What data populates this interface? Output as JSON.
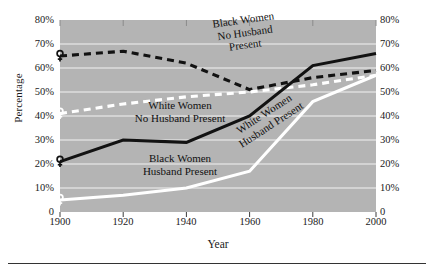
{
  "axes": {
    "ylabel": "Percentage",
    "xlabel": "Year",
    "yticks": [
      "80%",
      "70%",
      "60%",
      "50%",
      "40%",
      "30%",
      "20%",
      "10%",
      "0"
    ],
    "yticks_right": [
      "80%",
      "70%",
      "60%",
      "50%",
      "40%",
      "30%",
      "20%",
      "10%",
      "0"
    ],
    "xticks": [
      "1900",
      "1920",
      "1940",
      "1960",
      "1980",
      "2000"
    ]
  },
  "annotations": {
    "black_no_husband_line1": "Black Women",
    "black_no_husband_line2": "No Husband",
    "black_no_husband_line3": "Present",
    "white_no_husband_line1": "White Women",
    "white_no_husband_line2": "No Husband Present",
    "black_husband_line1": "Black Women",
    "black_husband_line2": "Husband Present",
    "white_husband_line1": "White Women",
    "white_husband_line2": "Husband Present"
  },
  "colors": {
    "plot_background": "#b4b4b4",
    "gridline": "#f2f2f2",
    "black_series": "#121212",
    "white_series": "#ffffff",
    "text": "#1a1a1a"
  },
  "chart_data": {
    "type": "line",
    "title": "",
    "xlabel": "Year",
    "ylabel": "Percentage",
    "x": [
      1900,
      1920,
      1940,
      1960,
      1980,
      2000
    ],
    "xlim": [
      1900,
      2000
    ],
    "ylim": [
      0,
      80
    ],
    "ytick_values": [
      0,
      10,
      20,
      30,
      40,
      50,
      60,
      70,
      80
    ],
    "grid": true,
    "legend": "inline-labels",
    "series": [
      {
        "name": "Black Women No Husband Present",
        "color": "#121212",
        "style": "dashed",
        "marker": "venus",
        "x": [
          1900,
          1920,
          1940,
          1960,
          1980,
          2000
        ],
        "values": [
          65,
          67,
          62,
          51,
          56,
          59
        ]
      },
      {
        "name": "White Women No Husband Present",
        "color": "#ffffff",
        "style": "dashed",
        "marker": "venus",
        "x": [
          1900,
          1920,
          1940,
          1960,
          1980,
          2000
        ],
        "values": [
          41,
          45,
          48,
          50,
          53,
          57
        ]
      },
      {
        "name": "Black Women Husband Present",
        "color": "#121212",
        "style": "solid",
        "marker": "venus",
        "x": [
          1900,
          1920,
          1940,
          1960,
          1980,
          2000
        ],
        "values": [
          21,
          30,
          29,
          40,
          61,
          66
        ]
      },
      {
        "name": "White Women Husband Present",
        "color": "#ffffff",
        "style": "solid",
        "marker": "venus",
        "x": [
          1900,
          1920,
          1940,
          1960,
          1980,
          2000
        ],
        "values": [
          5,
          7,
          10,
          17,
          46,
          57
        ]
      }
    ]
  }
}
